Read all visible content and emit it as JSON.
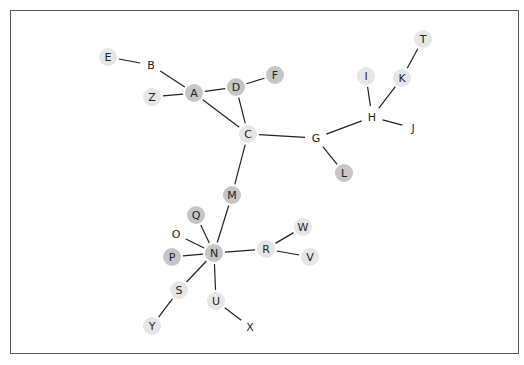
{
  "diagram": {
    "type": "network-graph",
    "node_radius": 9,
    "colors": {
      "dark": "#c6c6c6",
      "light": "#e6e6e6",
      "none": "#ffffff",
      "edge": "#222222",
      "frame": "#555555"
    },
    "nodes": [
      {
        "id": "E",
        "x": 108,
        "y": 57,
        "shade": "light"
      },
      {
        "id": "B",
        "x": 151,
        "y": 65,
        "shade": "none"
      },
      {
        "id": "Z",
        "x": 152,
        "y": 97,
        "shade": "light"
      },
      {
        "id": "A",
        "x": 194,
        "y": 93,
        "shade": "dark"
      },
      {
        "id": "D",
        "x": 236,
        "y": 87,
        "shade": "dark"
      },
      {
        "id": "F",
        "x": 275,
        "y": 75,
        "shade": "dark"
      },
      {
        "id": "C",
        "x": 248,
        "y": 134,
        "shade": "light"
      },
      {
        "id": "G",
        "x": 316,
        "y": 138,
        "shade": "none"
      },
      {
        "id": "L",
        "x": 344,
        "y": 173,
        "shade": "dark"
      },
      {
        "id": "H",
        "x": 372,
        "y": 117,
        "shade": "none"
      },
      {
        "id": "I",
        "x": 366,
        "y": 76,
        "shade": "light"
      },
      {
        "id": "K",
        "x": 402,
        "y": 78,
        "shade": "light"
      },
      {
        "id": "T",
        "x": 423,
        "y": 39,
        "shade": "light"
      },
      {
        "id": "J",
        "x": 413,
        "y": 128,
        "shade": "none"
      },
      {
        "id": "M",
        "x": 232,
        "y": 195,
        "shade": "dark"
      },
      {
        "id": "Q",
        "x": 196,
        "y": 215,
        "shade": "dark"
      },
      {
        "id": "O",
        "x": 176,
        "y": 234,
        "shade": "none"
      },
      {
        "id": "P",
        "x": 172,
        "y": 257,
        "shade": "dark"
      },
      {
        "id": "N",
        "x": 214,
        "y": 253,
        "shade": "dark"
      },
      {
        "id": "R",
        "x": 266,
        "y": 249,
        "shade": "light"
      },
      {
        "id": "W",
        "x": 303,
        "y": 227,
        "shade": "light"
      },
      {
        "id": "V",
        "x": 310,
        "y": 257,
        "shade": "light"
      },
      {
        "id": "S",
        "x": 179,
        "y": 290,
        "shade": "light"
      },
      {
        "id": "U",
        "x": 216,
        "y": 301,
        "shade": "light"
      },
      {
        "id": "Y",
        "x": 152,
        "y": 326,
        "shade": "light"
      },
      {
        "id": "X",
        "x": 250,
        "y": 327,
        "shade": "none"
      }
    ],
    "edges": [
      [
        "E",
        "B"
      ],
      [
        "B",
        "A"
      ],
      [
        "Z",
        "A"
      ],
      [
        "A",
        "D"
      ],
      [
        "D",
        "F"
      ],
      [
        "A",
        "C"
      ],
      [
        "D",
        "C"
      ],
      [
        "C",
        "G"
      ],
      [
        "G",
        "L"
      ],
      [
        "G",
        "H"
      ],
      [
        "H",
        "I"
      ],
      [
        "H",
        "K"
      ],
      [
        "K",
        "T"
      ],
      [
        "H",
        "J"
      ],
      [
        "C",
        "M"
      ],
      [
        "M",
        "N"
      ],
      [
        "Q",
        "N"
      ],
      [
        "O",
        "N"
      ],
      [
        "P",
        "N"
      ],
      [
        "N",
        "R"
      ],
      [
        "R",
        "W"
      ],
      [
        "R",
        "V"
      ],
      [
        "N",
        "S"
      ],
      [
        "S",
        "Y"
      ],
      [
        "N",
        "U"
      ],
      [
        "U",
        "X"
      ]
    ]
  }
}
